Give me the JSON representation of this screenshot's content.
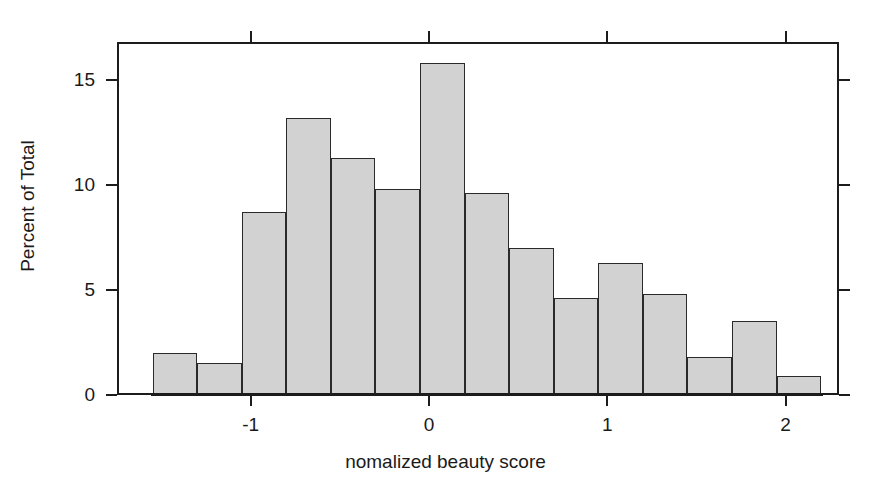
{
  "chart_data": {
    "type": "bar",
    "subtype": "histogram",
    "title": "",
    "xlabel": "nomalized beauty score",
    "ylabel": "Percent of Total",
    "xlim": [
      -1.75,
      2.3
    ],
    "ylim": [
      0,
      16.8
    ],
    "grid": false,
    "legend": null,
    "bin_width": 0.25,
    "bar_fill_color": "#d2d2d2",
    "bar_edge_color": "#2a2a2a",
    "axis_color": "#1c1c1c",
    "background_color": "#ffffff",
    "xticks": [
      -1,
      0,
      1,
      2
    ],
    "xtick_labels": [
      "-1",
      "0",
      "1",
      "2"
    ],
    "yticks": [
      0,
      5,
      10,
      15
    ],
    "ytick_labels": [
      "0",
      "5",
      "10",
      "15"
    ],
    "bins": [
      {
        "x0": -1.55,
        "x1": -1.3,
        "value": 2.0
      },
      {
        "x0": -1.3,
        "x1": -1.05,
        "value": 1.5
      },
      {
        "x0": -1.05,
        "x1": -0.8,
        "value": 8.7
      },
      {
        "x0": -0.8,
        "x1": -0.55,
        "value": 13.2
      },
      {
        "x0": -0.55,
        "x1": -0.3,
        "value": 11.3
      },
      {
        "x0": -0.3,
        "x1": -0.05,
        "value": 9.8
      },
      {
        "x0": -0.05,
        "x1": 0.2,
        "value": 15.8
      },
      {
        "x0": 0.2,
        "x1": 0.45,
        "value": 9.6
      },
      {
        "x0": 0.45,
        "x1": 0.7,
        "value": 7.0
      },
      {
        "x0": 0.7,
        "x1": 0.95,
        "value": 4.6
      },
      {
        "x0": 0.95,
        "x1": 1.2,
        "value": 6.3
      },
      {
        "x0": 1.2,
        "x1": 1.45,
        "value": 4.8
      },
      {
        "x0": 1.45,
        "x1": 1.7,
        "value": 1.8
      },
      {
        "x0": 1.7,
        "x1": 1.95,
        "value": 3.5
      },
      {
        "x0": 1.95,
        "x1": 2.2,
        "value": 0.9
      }
    ],
    "categories": [
      "-1.55",
      "-1.30",
      "-1.05",
      "-0.80",
      "-0.55",
      "-0.30",
      "-0.05",
      "0.20",
      "0.45",
      "0.70",
      "0.95",
      "1.20",
      "1.45",
      "1.70",
      "1.95"
    ],
    "values": [
      2.0,
      1.5,
      8.7,
      13.2,
      11.3,
      9.8,
      15.8,
      9.6,
      7.0,
      4.6,
      6.3,
      4.8,
      1.8,
      3.5,
      0.9
    ]
  }
}
